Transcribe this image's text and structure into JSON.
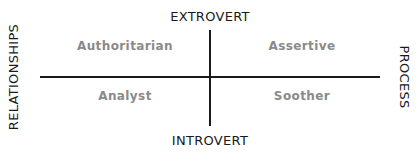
{
  "diagram": {
    "axes": {
      "top": "EXTROVERT",
      "bottom": "INTROVERT",
      "left": "RELATIONSHIPS",
      "right": "PROCESS"
    },
    "quadrants": {
      "top_left": "Authoritarian",
      "top_right": "Assertive",
      "bottom_left": "Analyst",
      "bottom_right": "Soother"
    },
    "colors": {
      "axis_line": "#1a1a1a",
      "axis_text": "#1a1a1a",
      "quadrant_text": "#8a8a8a",
      "background": "#ffffff"
    }
  }
}
